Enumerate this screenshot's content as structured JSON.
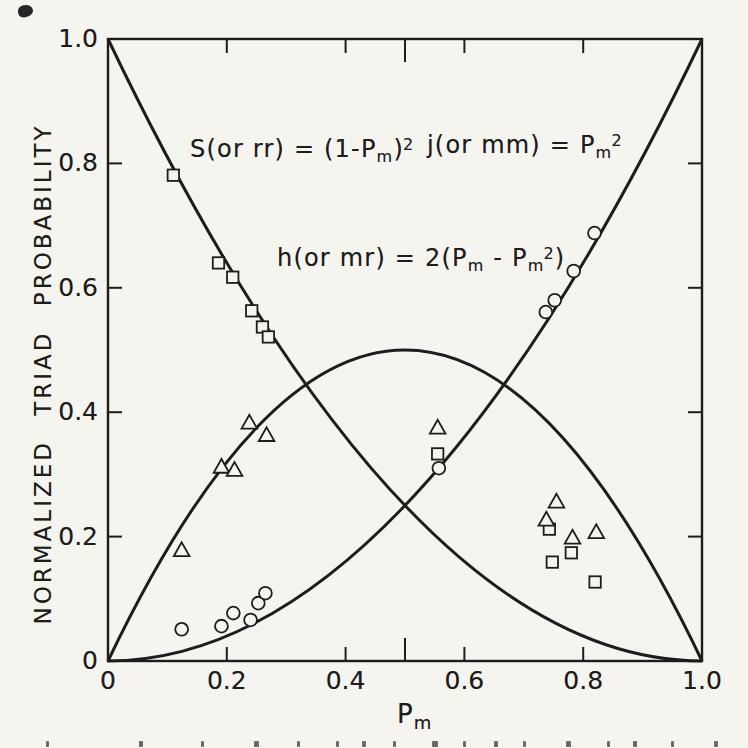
{
  "figure": {
    "paper": "#f6f4ef",
    "ink": "#1d1d1d"
  },
  "axis": {
    "y_title": "NORMALIZED TRIAD PROBABILITY",
    "x_title": {
      "base": "P",
      "sub": "m"
    },
    "x_tick_labels": [
      "0",
      "0.2",
      "0.4",
      "0.6",
      "0.8",
      "1.0"
    ],
    "y_tick_labels": [
      "1.0",
      "0.8",
      "0.6",
      "0.4",
      "0.2",
      "0"
    ]
  },
  "equations": {
    "s": {
      "pre": "S(or rr) = (1-P",
      "sub1": "m",
      "mid": ")",
      "sup1": "2"
    },
    "j": {
      "pre": "j(or mm) = P",
      "sub1": "m",
      "sup1": "2"
    },
    "h": {
      "pre": "h(or mr) = 2(P",
      "sub1": "m",
      "mid": " - P",
      "sub2": "m",
      "sup1": "2",
      "close": ")"
    }
  },
  "chart_data": {
    "type": "scatter",
    "title": "",
    "xlabel": "Pm",
    "ylabel": "NORMALIZED TRIAD PROBABILITY",
    "xlim": [
      0,
      1
    ],
    "ylim": [
      0,
      1
    ],
    "grid": false,
    "legend_position": "none",
    "x_ticks": [
      0,
      0.2,
      0.4,
      0.6,
      0.8,
      1.0
    ],
    "y_ticks": [
      1.0,
      0.8,
      0.6,
      0.4,
      0.2,
      0
    ],
    "x_tick_marks": [
      0.2,
      0.4,
      0.5,
      0.6,
      0.8
    ],
    "mid_tick": 0.5,
    "y_tick_marks": [
      0.2,
      0.4,
      0.6,
      0.8
    ],
    "curves": [
      {
        "id": "s-rr",
        "label": "S (or rr) = (1-Pm)^2",
        "marker": "square",
        "bezier": {
          "p0": [
            0,
            1
          ],
          "c": [
            0.5,
            0
          ],
          "p1": [
            1,
            0
          ]
        },
        "points": [
          [
            0.11,
            0.781
          ],
          [
            0.186,
            0.64
          ],
          [
            0.21,
            0.617
          ],
          [
            0.242,
            0.563
          ],
          [
            0.26,
            0.537
          ],
          [
            0.27,
            0.521
          ],
          [
            0.555,
            0.333
          ],
          [
            0.743,
            0.212
          ],
          [
            0.748,
            0.159
          ],
          [
            0.78,
            0.174
          ],
          [
            0.82,
            0.127
          ]
        ]
      },
      {
        "id": "h-mr",
        "label": "h (or mr) = 2(Pm - Pm^2)",
        "marker": "triangle",
        "bezier": {
          "p0": [
            0,
            0
          ],
          "c": [
            0.5,
            1
          ],
          "p1": [
            1,
            0
          ]
        },
        "points": [
          [
            0.124,
            0.178
          ],
          [
            0.191,
            0.312
          ],
          [
            0.213,
            0.307
          ],
          [
            0.238,
            0.383
          ],
          [
            0.267,
            0.363
          ],
          [
            0.555,
            0.375
          ],
          [
            0.738,
            0.227
          ],
          [
            0.755,
            0.256
          ],
          [
            0.782,
            0.198
          ],
          [
            0.822,
            0.207
          ]
        ]
      },
      {
        "id": "j-mm",
        "label": "j (or mm) = Pm^2",
        "marker": "circle",
        "bezier": {
          "p0": [
            0,
            0
          ],
          "c": [
            0.5,
            0
          ],
          "p1": [
            1,
            1
          ]
        },
        "points": [
          [
            0.124,
            0.051
          ],
          [
            0.191,
            0.056
          ],
          [
            0.211,
            0.077
          ],
          [
            0.24,
            0.066
          ],
          [
            0.253,
            0.093
          ],
          [
            0.265,
            0.109
          ],
          [
            0.557,
            0.31
          ],
          [
            0.737,
            0.561
          ],
          [
            0.752,
            0.58
          ],
          [
            0.784,
            0.627
          ],
          [
            0.819,
            0.688
          ]
        ]
      }
    ]
  },
  "caption_marks": [
    {
      "x": 46,
      "w": 3
    },
    {
      "x": 139,
      "w": 4
    },
    {
      "x": 201,
      "w": 3
    },
    {
      "x": 254,
      "w": 5
    },
    {
      "x": 297,
      "w": 3
    },
    {
      "x": 336,
      "w": 3
    },
    {
      "x": 362,
      "w": 4
    },
    {
      "x": 393,
      "w": 3
    },
    {
      "x": 432,
      "w": 6
    },
    {
      "x": 463,
      "w": 3
    },
    {
      "x": 494,
      "w": 4
    },
    {
      "x": 523,
      "w": 3
    },
    {
      "x": 566,
      "w": 5
    },
    {
      "x": 607,
      "w": 3
    },
    {
      "x": 633,
      "w": 4
    },
    {
      "x": 671,
      "w": 3
    },
    {
      "x": 714,
      "w": 4
    }
  ]
}
